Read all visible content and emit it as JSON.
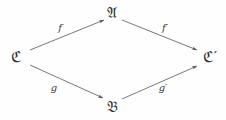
{
  "diagram": {
    "kind": "commutative-diagram",
    "shape": "diamond",
    "background_color": "#fefefe",
    "stroke_color": "#555555",
    "text_color": "#2e2e2e",
    "nodes": [
      {
        "id": "C",
        "label": "ℭ",
        "x": 16,
        "y": 57,
        "position": "left"
      },
      {
        "id": "A",
        "label": "𝔄",
        "x": 112,
        "y": 13,
        "position": "top"
      },
      {
        "id": "B",
        "label": "𝔅",
        "x": 112,
        "y": 107,
        "position": "bottom"
      },
      {
        "id": "Cprime",
        "label": "ℭ′",
        "x": 210,
        "y": 57,
        "position": "right"
      }
    ],
    "edges": [
      {
        "id": "f",
        "label": "f",
        "from": "C",
        "to": "A",
        "label_x": 60,
        "label_y": 28
      },
      {
        "id": "fprime",
        "label": "f′",
        "from": "A",
        "to": "Cprime",
        "label_x": 165,
        "label_y": 28
      },
      {
        "id": "g",
        "label": "g",
        "from": "C",
        "to": "B",
        "label_x": 54,
        "label_y": 88
      },
      {
        "id": "gprime",
        "label": "g′",
        "from": "B",
        "to": "Cprime",
        "label_x": 163,
        "label_y": 88
      }
    ]
  }
}
